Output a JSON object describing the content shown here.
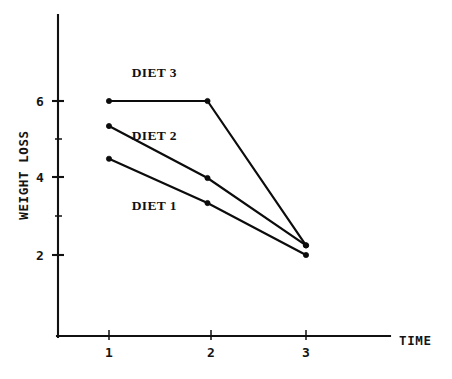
{
  "chart_data": {
    "type": "line",
    "title": "",
    "xlabel": "TIME",
    "ylabel": "WEIGHT LOSS",
    "x": [
      1,
      2,
      3
    ],
    "categories": [
      "1",
      "2",
      "3"
    ],
    "xtick_labels": [
      "1",
      "2",
      "3"
    ],
    "ytick_labels": [
      "2",
      "4",
      "6"
    ],
    "ytick_values": [
      2,
      4,
      6
    ],
    "yminor_values": [
      3,
      5
    ],
    "xlim": [
      0.35,
      3.85
    ],
    "ylim": [
      0.0,
      7.6
    ],
    "grid": false,
    "legend": "inline-labels",
    "series": [
      {
        "name": "DIET 1",
        "label": "DIET 1",
        "values": [
          4.5,
          3.35,
          2.0
        ],
        "color": "#0c0c0c",
        "label_x": 1.46,
        "label_y": 3.18
      },
      {
        "name": "DIET 2",
        "label": "DIET 2",
        "values": [
          5.35,
          4.0,
          2.25
        ],
        "color": "#0c0c0c",
        "label_x": 1.46,
        "label_y": 4.98
      },
      {
        "name": "DIET 3",
        "label": "DIET 3",
        "values": [
          6.0,
          6.0,
          2.25
        ],
        "color": "#0c0c0c",
        "label_x": 1.46,
        "label_y": 6.62
      }
    ]
  },
  "axis": {
    "y_label_text": "WEIGHT LOSS",
    "x_label_text": "TIME",
    "ytick_2": "2",
    "ytick_4": "4",
    "ytick_6": "6",
    "xtick_1": "1",
    "xtick_2": "2",
    "xtick_3": "3"
  },
  "labels": {
    "diet1": "DIET 1",
    "diet2": "DIET 2",
    "diet3": "DIET 3"
  }
}
